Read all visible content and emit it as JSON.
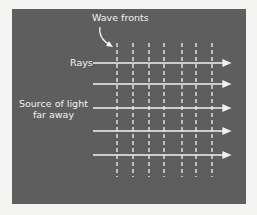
{
  "diagram": {
    "labels": {
      "wave_fronts": "Wave fronts",
      "rays": "Rays",
      "source_line1": "Source of light",
      "source_line2": "far away"
    },
    "colors": {
      "background": "#f4f4f2",
      "panel": "#5e5e5e",
      "lines": "#f2f2f2"
    },
    "wave_front_count": 7,
    "ray_count": 5
  }
}
